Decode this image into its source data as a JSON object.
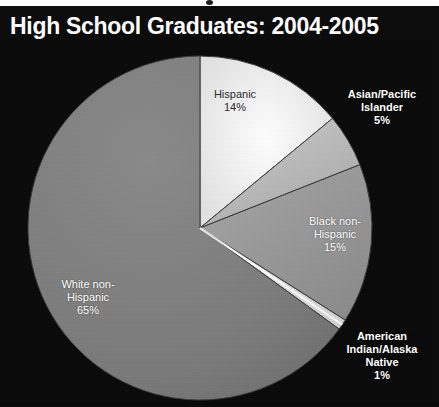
{
  "title": "High School Graduates: 2004-2005",
  "colors": {
    "background": "#0a0a0a",
    "title_bar": "#0b0b0b",
    "title_text": "#ffffff",
    "label_outside": "#ffffff",
    "label_inside": "#2a2a2a",
    "slice_hispanic": "#f0f0f0",
    "slice_asian": "#bdbdbd",
    "slice_black": "#9a9a9a",
    "slice_aian": "#e8e8e8",
    "slice_white": "#7d7d7d",
    "slice_edge": "#3a3a3a"
  },
  "chart_data": {
    "type": "pie",
    "title": "High School Graduates: 2004-2005",
    "xlabel": "",
    "ylabel": "",
    "legend_position": "none",
    "grid": false,
    "units": "percent",
    "total": 100,
    "categories": [
      "Hispanic",
      "Asian/Pacific Islander",
      "Black non-Hispanic",
      "American Indian/Alaska Native",
      "White non-Hispanic"
    ],
    "values": [
      14,
      5,
      15,
      1,
      65
    ],
    "slices": [
      {
        "label": "Hispanic",
        "label_lines": [
          "Hispanic"
        ],
        "value": 14,
        "value_text": "14%",
        "color": "#f0f0f0",
        "label_placement": "inside",
        "start_angle_deg": 0,
        "end_angle_deg": 50.4
      },
      {
        "label": "Asian/Pacific Islander",
        "label_lines": [
          "Asian/Pacific",
          "Islander"
        ],
        "value": 5,
        "value_text": "5%",
        "color": "#bdbdbd",
        "label_placement": "outside",
        "start_angle_deg": 50.4,
        "end_angle_deg": 68.4
      },
      {
        "label": "Black non-Hispanic",
        "label_lines": [
          "Black non-",
          "Hispanic"
        ],
        "value": 15,
        "value_text": "15%",
        "color": "#9a9a9a",
        "label_placement": "inside",
        "start_angle_deg": 68.4,
        "end_angle_deg": 122.4
      },
      {
        "label": "American Indian/Alaska Native",
        "label_lines": [
          "American",
          "Indian/Alaska",
          "Native"
        ],
        "value": 1,
        "value_text": "1%",
        "color": "#e8e8e8",
        "label_placement": "outside",
        "start_angle_deg": 122.4,
        "end_angle_deg": 126.0
      },
      {
        "label": "White non-Hispanic",
        "label_lines": [
          "White non-",
          "Hispanic"
        ],
        "value": 65,
        "value_text": "65%",
        "color": "#7d7d7d",
        "label_placement": "inside",
        "start_angle_deg": 126.0,
        "end_angle_deg": 360
      }
    ]
  },
  "labels": {
    "hispanic": {
      "line1": "Hispanic",
      "pct": "14%"
    },
    "asian": {
      "line1": "Asian/Pacific",
      "line2": "Islander",
      "pct": "5%"
    },
    "black": {
      "line1": "Black non-",
      "line2": "Hispanic",
      "pct": "15%"
    },
    "aian": {
      "line1": "American",
      "line2": "Indian/Alaska",
      "line3": "Native",
      "pct": "1%"
    },
    "white": {
      "line1": "White non-",
      "line2": "Hispanic",
      "pct": "65%"
    }
  }
}
